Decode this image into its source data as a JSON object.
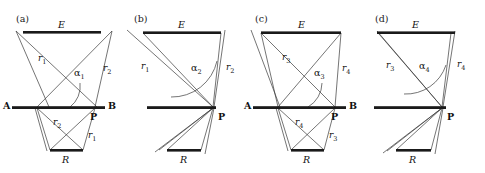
{
  "figure": {
    "type": "optics-geometry-diagram",
    "width": 485,
    "height": 173,
    "background_color": "#ffffff",
    "line_color": "#333333",
    "bar_color": "#1a1a1a",
    "text_color": "#111111"
  },
  "panels": [
    {
      "id": "a",
      "label": "(a)",
      "bars": {
        "top_label": "E",
        "middle_left_label": "A",
        "middle_right_label": "B",
        "bottom_label": "R",
        "point_label": "P"
      },
      "angle": {
        "symbol": "α",
        "subscript": "1"
      },
      "rays": [
        {
          "name": "r",
          "subscript": "1",
          "position": "upper-left"
        },
        {
          "name": "r",
          "subscript": "2",
          "position": "upper-right"
        },
        {
          "name": "r",
          "subscript": "2",
          "position": "lower-middle"
        },
        {
          "name": "r",
          "subscript": "1",
          "position": "lower-right"
        }
      ]
    },
    {
      "id": "b",
      "label": "(b)",
      "bars": {
        "top_label": "E",
        "middle_left_label": "",
        "middle_right_label": "",
        "bottom_label": "R",
        "point_label": "P"
      },
      "angle": {
        "symbol": "α",
        "subscript": "2"
      },
      "rays": [
        {
          "name": "r",
          "subscript": "1",
          "position": "upper-left"
        },
        {
          "name": "r",
          "subscript": "2",
          "position": "upper-right"
        }
      ]
    },
    {
      "id": "c",
      "label": "(c)",
      "bars": {
        "top_label": "E",
        "middle_left_label": "A",
        "middle_right_label": "B",
        "bottom_label": "R",
        "point_label": "P"
      },
      "angle": {
        "symbol": "α",
        "subscript": "3"
      },
      "rays": [
        {
          "name": "r",
          "subscript": "3",
          "position": "upper-left"
        },
        {
          "name": "r",
          "subscript": "4",
          "position": "upper-right"
        },
        {
          "name": "r",
          "subscript": "4",
          "position": "lower-middle"
        },
        {
          "name": "r",
          "subscript": "3",
          "position": "lower-right"
        }
      ]
    },
    {
      "id": "d",
      "label": "(d)",
      "bars": {
        "top_label": "E",
        "middle_left_label": "",
        "middle_right_label": "",
        "bottom_label": "R",
        "point_label": "P"
      },
      "angle": {
        "symbol": "α",
        "subscript": "4"
      },
      "rays": [
        {
          "name": "r",
          "subscript": "3",
          "position": "upper-left"
        },
        {
          "name": "r",
          "subscript": "4",
          "position": "upper-right"
        }
      ]
    }
  ]
}
